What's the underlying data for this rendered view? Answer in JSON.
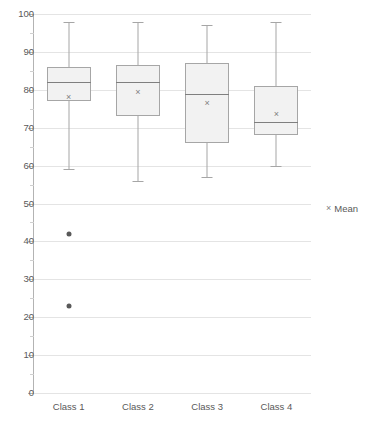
{
  "chart_data": {
    "type": "box",
    "title": "",
    "subtitle": "",
    "xlabel": "",
    "ylabel": "",
    "ylim": [
      0,
      100
    ],
    "ytick_step": 10,
    "yminor_step": 5,
    "grid": true,
    "grid_axis": "y",
    "legend_position": "right",
    "categories": [
      "Class 1",
      "Class 2",
      "Class 3",
      "Class 4"
    ],
    "ytick_labels": [
      "0",
      "10",
      "20",
      "30",
      "40",
      "50",
      "60",
      "70",
      "80",
      "90",
      "100"
    ],
    "ytick_values": [
      0,
      10,
      20,
      30,
      40,
      50,
      60,
      70,
      80,
      90,
      100
    ],
    "legend": [
      {
        "label": "Mean",
        "marker": "x-marker",
        "glyph": "×",
        "color": "#808080"
      }
    ],
    "series": [
      {
        "name": "Class 1",
        "whisker_low": 59,
        "q1": 77,
        "median": 82,
        "q3": 86,
        "whisker_high": 98,
        "mean": 78,
        "outliers": [
          42,
          23
        ]
      },
      {
        "name": "Class 2",
        "whisker_low": 56,
        "q1": 73,
        "median": 82,
        "q3": 86.5,
        "whisker_high": 98,
        "mean": 79.5,
        "outliers": []
      },
      {
        "name": "Class 3",
        "whisker_low": 57,
        "q1": 66,
        "median": 79,
        "q3": 87,
        "whisker_high": 97,
        "mean": 76.5,
        "outliers": []
      },
      {
        "name": "Class 4",
        "whisker_low": 60,
        "q1": 68,
        "median": 71.5,
        "q3": 81,
        "whisker_high": 98,
        "mean": 73.5,
        "outliers": []
      }
    ],
    "colors": {
      "box_fill": "#f2f2f2",
      "box_border": "#a6a6a6",
      "median": "#7f7f7f",
      "whisker": "#a6a6a6",
      "outlier": "#595959",
      "mean_marker": "#808080",
      "gridline": "#e4e4e4",
      "axis": "#b3b3b3",
      "text": "#595959",
      "background": "#ffffff"
    }
  }
}
